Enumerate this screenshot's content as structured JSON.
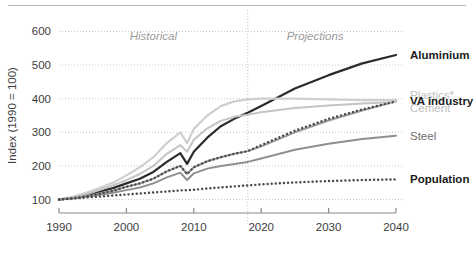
{
  "chart_data": {
    "type": "line",
    "title": "",
    "xlabel": "",
    "ylabel": "Index (1990 = 100)",
    "xlim": [
      1990,
      2040
    ],
    "ylim": [
      60,
      640
    ],
    "xticks": [
      1990,
      2000,
      2010,
      2020,
      2030,
      2040
    ],
    "yticks": [
      100,
      200,
      300,
      400,
      500,
      600
    ],
    "grid": true,
    "legend_position": "right-inline",
    "annotations": [
      {
        "text": "Historical",
        "x": 2004,
        "y": 575,
        "style": "italic-gray"
      },
      {
        "text": "Projections",
        "x": 2028,
        "y": 575,
        "style": "italic-gray"
      }
    ],
    "divider": {
      "x": 2018,
      "style": "dotted",
      "label_left": "Historical",
      "label_right": "Projections"
    },
    "x": [
      1990,
      1992,
      1994,
      1996,
      1998,
      2000,
      2002,
      2004,
      2006,
      2008,
      2009,
      2010,
      2012,
      2014,
      2016,
      2018,
      2020,
      2025,
      2030,
      2035,
      2040
    ],
    "series": [
      {
        "name": "Aluminium",
        "color": "#2b2b2b",
        "style": "solid",
        "width": 2.2,
        "label_color": "dark",
        "values": [
          100,
          106,
          114,
          124,
          134,
          148,
          162,
          182,
          212,
          238,
          206,
          242,
          284,
          318,
          340,
          358,
          378,
          430,
          470,
          505,
          530
        ]
      },
      {
        "name": "Plastics*",
        "color": "#cfcfcf",
        "style": "solid",
        "width": 2.2,
        "label_color": "light",
        "values": [
          100,
          108,
          120,
          134,
          150,
          172,
          196,
          226,
          268,
          300,
          268,
          310,
          350,
          378,
          392,
          398,
          400,
          400,
          398,
          396,
          396
        ]
      },
      {
        "name": "VA industry",
        "color": "#9a9a9a",
        "style": "solid",
        "width": 2.0,
        "label_color": "dark",
        "values": [
          100,
          104,
          110,
          118,
          126,
          138,
          148,
          162,
          184,
          200,
          176,
          196,
          214,
          226,
          236,
          244,
          258,
          300,
          335,
          365,
          392
        ]
      },
      {
        "name": "Cement",
        "color": "#c4c4c4",
        "style": "solid",
        "width": 2.0,
        "label_color": "light",
        "values": [
          100,
          106,
          116,
          128,
          142,
          158,
          176,
          200,
          236,
          262,
          242,
          278,
          312,
          334,
          346,
          352,
          360,
          372,
          380,
          386,
          390
        ]
      },
      {
        "name": "Steel",
        "color": "#8f8f8f",
        "style": "solid",
        "width": 2.0,
        "label_color": "mid",
        "values": [
          100,
          103,
          108,
          114,
          120,
          128,
          136,
          148,
          166,
          180,
          158,
          178,
          192,
          200,
          206,
          212,
          222,
          248,
          266,
          280,
          290
        ]
      },
      {
        "name": "Population",
        "color": "#4a4a4a",
        "style": "dotted",
        "width": 2.4,
        "label_color": "dark",
        "values": [
          100,
          103,
          106,
          109,
          112,
          115,
          118,
          121,
          124,
          127,
          128,
          129,
          133,
          136,
          139,
          142,
          145,
          151,
          155,
          158,
          160
        ]
      },
      {
        "name": "VA industry projection",
        "color": "#4a4a4a",
        "style": "dotted",
        "width": 2.4,
        "label_color": "dark",
        "hidden_label": true,
        "values": [
          100,
          104,
          110,
          118,
          126,
          138,
          148,
          162,
          184,
          200,
          176,
          196,
          214,
          226,
          236,
          244,
          262,
          305,
          340,
          368,
          392
        ]
      }
    ],
    "legend_entries": [
      {
        "label": "Aluminium",
        "color_class": "dark",
        "y_value": 530
      },
      {
        "label": "Plastics*",
        "color_class": "light",
        "y_value": 412
      },
      {
        "label": "VA industry",
        "color_class": "dark",
        "y_value": 392
      },
      {
        "label": "Cement",
        "color_class": "light",
        "y_value": 372
      },
      {
        "label": "Steel",
        "color_class": "mid",
        "y_value": 290
      },
      {
        "label": "Population",
        "color_class": "dark",
        "y_value": 160
      }
    ]
  }
}
